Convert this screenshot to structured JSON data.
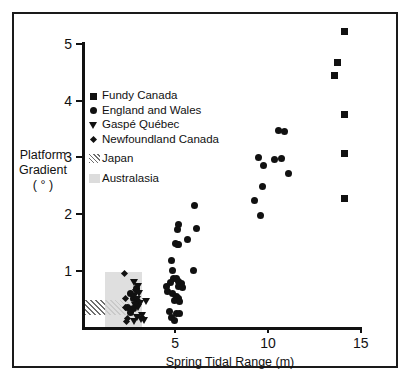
{
  "chart_data": {
    "type": "scatter",
    "title": "",
    "xlabel": "Spring Tidal Range (m)",
    "ylabel_lines": [
      "Platform",
      "Gradient",
      "( ° )"
    ],
    "xlim": [
      0,
      15.8
    ],
    "ylim": [
      0,
      5.35
    ],
    "xticks": [
      5,
      10,
      15
    ],
    "yticks": [
      1,
      2,
      3,
      4,
      5
    ],
    "grid": false,
    "legend_position": "upper-left",
    "series": [
      {
        "name": "Fundy Canada",
        "marker": "square",
        "points": [
          [
            14.15,
            5.22
          ],
          [
            13.75,
            4.68
          ],
          [
            13.6,
            4.45
          ],
          [
            14.15,
            3.75
          ],
          [
            14.15,
            3.07
          ],
          [
            14.15,
            2.27
          ]
        ]
      },
      {
        "name": "England and Wales",
        "marker": "circle",
        "points": [
          [
            10.55,
            3.47
          ],
          [
            10.9,
            3.46
          ],
          [
            9.5,
            2.99
          ],
          [
            10.35,
            2.97
          ],
          [
            10.75,
            2.98
          ],
          [
            9.75,
            2.85
          ],
          [
            11.1,
            2.71
          ],
          [
            9.7,
            2.49
          ],
          [
            9.25,
            2.24
          ],
          [
            9.6,
            1.98
          ],
          [
            6.05,
            2.16
          ],
          [
            5.15,
            1.82
          ],
          [
            5.1,
            1.73
          ],
          [
            6.15,
            1.74
          ],
          [
            5.65,
            1.56
          ],
          [
            5.0,
            1.49
          ],
          [
            5.1,
            1.47
          ],
          [
            5.2,
            1.46
          ],
          [
            4.8,
            1.19
          ],
          [
            4.85,
            1.01
          ],
          [
            6.0,
            1.0
          ],
          [
            4.9,
            0.87
          ],
          [
            5.05,
            0.86
          ],
          [
            5.2,
            0.82
          ],
          [
            4.75,
            0.79
          ],
          [
            5.35,
            0.78
          ],
          [
            4.55,
            0.73
          ],
          [
            5.15,
            0.72
          ],
          [
            5.4,
            0.71
          ],
          [
            4.6,
            0.64
          ],
          [
            4.85,
            0.6
          ],
          [
            5.05,
            0.55
          ],
          [
            5.2,
            0.52
          ],
          [
            4.95,
            0.48
          ],
          [
            5.25,
            0.46
          ],
          [
            4.7,
            0.28
          ],
          [
            5.05,
            0.25
          ],
          [
            5.25,
            0.24
          ],
          [
            4.8,
            0.18
          ],
          [
            4.95,
            0.13
          ],
          [
            2.9,
            0.69
          ],
          [
            2.6,
            0.6
          ],
          [
            2.75,
            0.52
          ],
          [
            2.95,
            0.45
          ],
          [
            2.45,
            0.36
          ],
          [
            2.75,
            0.33
          ],
          [
            2.6,
            0.27
          ]
        ]
      },
      {
        "name": "Gaspé Québec",
        "marker": "triangle-down",
        "points": [
          [
            2.8,
            0.79
          ],
          [
            3.0,
            0.72
          ],
          [
            2.9,
            0.62
          ],
          [
            3.05,
            0.6
          ],
          [
            2.75,
            0.55
          ],
          [
            2.95,
            0.5
          ],
          [
            3.4,
            0.45
          ],
          [
            3.1,
            0.42
          ],
          [
            2.85,
            0.39
          ],
          [
            3.0,
            0.35
          ],
          [
            2.7,
            0.31
          ],
          [
            3.2,
            0.22
          ],
          [
            2.95,
            0.18
          ],
          [
            3.15,
            0.14
          ],
          [
            3.3,
            0.12
          ],
          [
            2.8,
            0.1
          ]
        ]
      },
      {
        "name": "Newfoundland Canada",
        "marker": "diamond",
        "points": [
          [
            2.25,
            0.96
          ],
          [
            2.3,
            0.52
          ],
          [
            2.3,
            0.35
          ],
          [
            2.4,
            0.15
          ],
          [
            2.35,
            0.1
          ]
        ]
      }
    ],
    "regions": [
      {
        "name": "Japan",
        "style": "hatched",
        "x_range": [
          0.15,
          2.7
        ],
        "y_range": [
          0.2,
          0.48
        ]
      },
      {
        "name": "Australasia",
        "style": "solid-grey",
        "x_range": [
          1.2,
          3.2
        ],
        "y_range": [
          0.0,
          0.98
        ]
      }
    ]
  },
  "axes": {
    "y_title": [
      "Platform",
      "Gradient",
      "( ° )"
    ],
    "x_title": "Spring Tidal Range (m)",
    "x_tick_labels": [
      "5",
      "10",
      "15"
    ],
    "y_tick_labels": [
      "1",
      "2",
      "3",
      "4",
      "5"
    ]
  },
  "legend": {
    "entries": [
      {
        "label": "Fundy Canada",
        "marker": "square-marker"
      },
      {
        "label": "England and Wales",
        "marker": "circle-marker"
      },
      {
        "label": "Gaspé Québec",
        "marker": "triangle-down-marker"
      },
      {
        "label": "Newfoundland Canada",
        "marker": "diamond-marker"
      },
      {
        "label": "Japan",
        "marker": "hatched-swatch"
      },
      {
        "label": "Australasia",
        "marker": "grey-swatch"
      }
    ]
  },
  "colors": {
    "marker": "#111111",
    "axis": "#111111",
    "frame": "#1a1a1a",
    "japan_hatch": "#6e6e6e",
    "australasia_fill": "#d9d9d9",
    "background": "#ffffff"
  }
}
